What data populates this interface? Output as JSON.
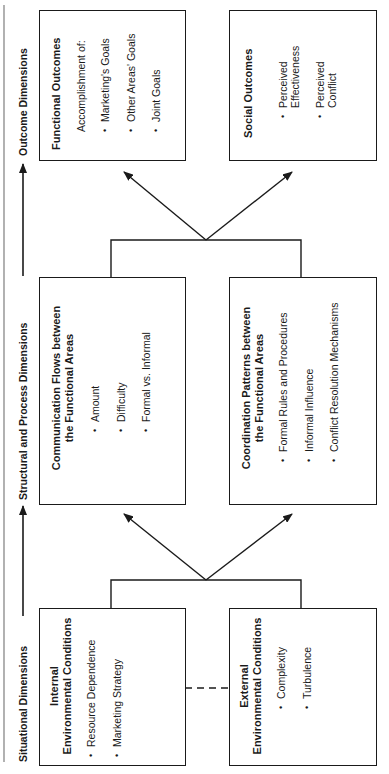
{
  "axis": {
    "labels": [
      "Situational Dimensions",
      "Structural and Process Dimensions",
      "Outcome Dimensions"
    ]
  },
  "boxes": {
    "internal": {
      "title_line1": "Internal",
      "title_line2": "Environmental Conditions",
      "items": [
        "Resource Dependence",
        "Marketing Strategy"
      ]
    },
    "external": {
      "title_line1": "External",
      "title_line2": "Environmental Conditions",
      "items": [
        "Complexity",
        "Turbulence"
      ]
    },
    "communication": {
      "title_line1": "Communication Flows between",
      "title_line2": "the Functional Areas",
      "items": [
        "Amount",
        "Difficulty",
        "Formal vs. Informal"
      ]
    },
    "coordination": {
      "title_line1": "Coordination Patterns between",
      "title_line2": "the Functional Areas",
      "items": [
        "Formal Rules and Procedures",
        "Informal Influence",
        "Conflict Resolution Mechanisms"
      ]
    },
    "functional": {
      "title": "Functional Outcomes",
      "subtitle": "Accomplishment of:",
      "items": [
        "Marketing's Goals",
        "Other Areas' Goals",
        "Joint Goals"
      ]
    },
    "social": {
      "title": "Social Outcomes",
      "items": [
        "Perceived Effectiveness",
        "Perceived Conflict"
      ]
    }
  },
  "colors": {
    "line": "#1a1a1a",
    "border_rule": "#888888",
    "background": "#ffffff"
  }
}
